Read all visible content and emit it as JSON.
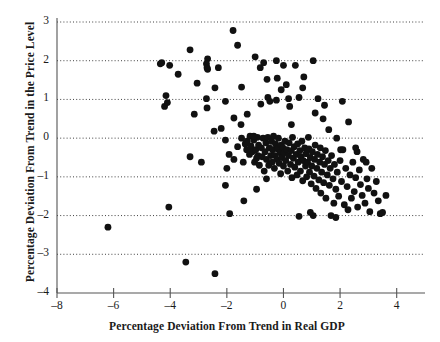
{
  "chart_data": {
    "type": "scatter",
    "title": "",
    "xlabel": "Percentage Deviation From Trend in Real GDP",
    "ylabel": "Percentage Deviation From Trend in the Price Level",
    "xlim": [
      -8,
      5
    ],
    "ylim": [
      -4,
      3
    ],
    "xticks": [
      -8,
      -6,
      -4,
      -2,
      0,
      2,
      4
    ],
    "yticks": [
      -4,
      -3,
      -2,
      -1,
      0,
      1,
      2,
      3
    ],
    "xtick_labels": [
      "-8",
      "-6",
      "-4",
      "-2",
      "0",
      "2",
      "4"
    ],
    "ytick_labels": [
      "-4",
      "-3",
      "-2",
      "-1",
      "0",
      "1",
      "2",
      "3"
    ],
    "grid": true,
    "grid_axis": "y",
    "grid_style": "dotted",
    "legend": null,
    "marker": "filled-circle",
    "marker_color": "#111111",
    "marker_size": 4.6,
    "n_points": 213,
    "series": [
      {
        "name": "Price level vs Real GDP deviation",
        "points": [
          [
            -6.2,
            -2.3
          ],
          [
            -4.05,
            -1.78
          ],
          [
            -3.45,
            -3.2
          ],
          [
            -2.42,
            -3.5
          ],
          [
            -4.35,
            1.92
          ],
          [
            -4.3,
            1.95
          ],
          [
            -4.15,
            1.1
          ],
          [
            -4.2,
            0.82
          ],
          [
            -4.1,
            0.92
          ],
          [
            -4.02,
            1.88
          ],
          [
            -3.72,
            1.65
          ],
          [
            -3.3,
            2.28
          ],
          [
            -3.3,
            -0.48
          ],
          [
            -3.15,
            0.62
          ],
          [
            -2.68,
            2.05
          ],
          [
            -2.72,
            1.92
          ],
          [
            -2.7,
            1.82
          ],
          [
            -2.68,
            1.78
          ],
          [
            -2.7,
            0.78
          ],
          [
            -2.72,
            1.02
          ],
          [
            -2.42,
            1.3
          ],
          [
            -2.3,
            1.82
          ],
          [
            -2.45,
            0.18
          ],
          [
            -2.2,
            0.25
          ],
          [
            -2.05,
            -0.05
          ],
          [
            -2.0,
            -0.78
          ],
          [
            -1.92,
            -0.42
          ],
          [
            -1.78,
            2.78
          ],
          [
            -1.75,
            -0.55
          ],
          [
            -1.62,
            2.4
          ],
          [
            -1.5,
            0.35
          ],
          [
            -1.48,
            0.0
          ],
          [
            -1.42,
            -0.62
          ],
          [
            -1.4,
            -1.62
          ],
          [
            -1.35,
            -0.15
          ],
          [
            -1.3,
            -0.3
          ],
          [
            -1.28,
            -0.08
          ],
          [
            -1.2,
            -0.42
          ],
          [
            -1.18,
            0.05
          ],
          [
            -1.15,
            -0.2
          ],
          [
            -1.1,
            -0.35
          ],
          [
            -1.05,
            -0.05
          ],
          [
            -1.02,
            -0.62
          ],
          [
            -1.0,
            2.1
          ],
          [
            -0.98,
            -0.3
          ],
          [
            -0.95,
            -0.52
          ],
          [
            -0.92,
            0.02
          ],
          [
            -0.9,
            -0.45
          ],
          [
            -0.88,
            -0.18
          ],
          [
            -0.85,
            -0.7
          ],
          [
            -0.82,
            1.82
          ],
          [
            -0.8,
            0.88
          ],
          [
            -0.78,
            -0.25
          ],
          [
            -0.75,
            -0.48
          ],
          [
            -0.72,
            0.0
          ],
          [
            -0.7,
            1.95
          ],
          [
            -0.68,
            -0.85
          ],
          [
            -0.65,
            -0.35
          ],
          [
            -0.62,
            -0.12
          ],
          [
            -0.6,
            -0.55
          ],
          [
            -0.58,
            1.52
          ],
          [
            -0.55,
            0.02
          ],
          [
            -0.52,
            -0.7
          ],
          [
            -0.5,
            -0.25
          ],
          [
            -0.48,
            0.95
          ],
          [
            -0.45,
            -0.45
          ],
          [
            -0.42,
            -0.08
          ],
          [
            -0.4,
            -0.62
          ],
          [
            -0.38,
            -0.3
          ],
          [
            -0.35,
            0.05
          ],
          [
            -0.32,
            -0.78
          ],
          [
            -0.3,
            -0.45
          ],
          [
            -0.28,
            -0.15
          ],
          [
            -0.25,
            2.0
          ],
          [
            -0.22,
            -0.55
          ],
          [
            -0.2,
            -0.28
          ],
          [
            -0.18,
            0.0
          ],
          [
            -0.15,
            -0.65
          ],
          [
            -0.12,
            -0.38
          ],
          [
            -0.1,
            -0.92
          ],
          [
            -0.08,
            -0.18
          ],
          [
            -0.05,
            -0.5
          ],
          [
            -0.02,
            -0.25
          ],
          [
            0.0,
            1.88
          ],
          [
            0.0,
            -0.72
          ],
          [
            0.02,
            -0.38
          ],
          [
            0.05,
            -0.08
          ],
          [
            0.08,
            -0.58
          ],
          [
            0.1,
            1.38
          ],
          [
            0.12,
            -0.3
          ],
          [
            0.15,
            -0.85
          ],
          [
            0.18,
            -0.45
          ],
          [
            0.2,
            -0.12
          ],
          [
            0.22,
            0.82
          ],
          [
            0.25,
            -0.68
          ],
          [
            0.28,
            -0.32
          ],
          [
            0.3,
            -1.02
          ],
          [
            0.32,
            0.02
          ],
          [
            0.35,
            -0.52
          ],
          [
            0.38,
            -0.22
          ],
          [
            0.4,
            -0.75
          ],
          [
            0.42,
            1.88
          ],
          [
            0.45,
            -0.42
          ],
          [
            0.48,
            -0.95
          ],
          [
            0.5,
            -0.15
          ],
          [
            0.52,
            -0.62
          ],
          [
            0.55,
            1.05
          ],
          [
            0.58,
            -0.32
          ],
          [
            0.6,
            -0.85
          ],
          [
            0.62,
            -0.48
          ],
          [
            0.65,
            -0.08
          ],
          [
            0.68,
            -1.1
          ],
          [
            0.7,
            -0.58
          ],
          [
            0.72,
            1.58
          ],
          [
            0.75,
            -0.25
          ],
          [
            0.78,
            -0.72
          ],
          [
            0.8,
            -0.4
          ],
          [
            0.82,
            -1.0
          ],
          [
            0.85,
            -0.62
          ],
          [
            0.88,
            0.02
          ],
          [
            0.9,
            -0.28
          ],
          [
            0.92,
            -0.88
          ],
          [
            0.95,
            -0.5
          ],
          [
            0.98,
            -1.18
          ],
          [
            1.0,
            -0.72
          ],
          [
            1.02,
            -0.35
          ],
          [
            1.05,
            2.0
          ],
          [
            1.08,
            -0.98
          ],
          [
            1.1,
            -0.55
          ],
          [
            1.12,
            -0.18
          ],
          [
            1.15,
            -1.3
          ],
          [
            1.18,
            -0.78
          ],
          [
            1.2,
            -0.42
          ],
          [
            1.22,
            1.02
          ],
          [
            1.25,
            -1.08
          ],
          [
            1.28,
            -0.62
          ],
          [
            1.3,
            -0.25
          ],
          [
            1.32,
            -1.42
          ],
          [
            1.35,
            -0.88
          ],
          [
            1.38,
            -0.48
          ],
          [
            1.4,
            0.5
          ],
          [
            1.42,
            -1.15
          ],
          [
            1.45,
            -0.68
          ],
          [
            1.48,
            -0.32
          ],
          [
            1.5,
            -1.55
          ],
          [
            1.55,
            -0.95
          ],
          [
            1.58,
            -0.58
          ],
          [
            1.6,
            0.22
          ],
          [
            1.62,
            -1.22
          ],
          [
            1.65,
            -0.78
          ],
          [
            1.68,
            -2.0
          ],
          [
            1.7,
            -0.45
          ],
          [
            1.75,
            -1.05
          ],
          [
            1.78,
            -1.68
          ],
          [
            1.8,
            -0.68
          ],
          [
            1.85,
            -1.32
          ],
          [
            1.88,
            0.0
          ],
          [
            1.9,
            -0.88
          ],
          [
            1.95,
            -1.5
          ],
          [
            2.0,
            -0.58
          ],
          [
            2.05,
            -1.12
          ],
          [
            2.1,
            -0.3
          ],
          [
            2.15,
            -1.72
          ],
          [
            2.2,
            -0.78
          ],
          [
            2.25,
            -1.25
          ],
          [
            2.3,
            0.42
          ],
          [
            2.35,
            -0.95
          ],
          [
            2.4,
            -1.55
          ],
          [
            2.45,
            -0.62
          ],
          [
            2.5,
            -1.38
          ],
          [
            2.55,
            -1.02
          ],
          [
            2.6,
            -0.35
          ],
          [
            2.62,
            -1.78
          ],
          [
            2.68,
            -0.82
          ],
          [
            2.72,
            -1.2
          ],
          [
            2.78,
            -1.48
          ],
          [
            2.82,
            -0.55
          ],
          [
            2.88,
            -1.68
          ],
          [
            2.95,
            -1.05
          ],
          [
            3.0,
            -1.3
          ],
          [
            3.05,
            -1.9
          ],
          [
            3.12,
            -0.78
          ],
          [
            3.2,
            -1.42
          ],
          [
            3.28,
            -1.12
          ],
          [
            3.35,
            -1.62
          ],
          [
            3.42,
            -1.95
          ],
          [
            3.5,
            -1.92
          ],
          [
            3.62,
            -1.48
          ],
          [
            0.55,
            -2.02
          ],
          [
            1.05,
            -2.0
          ],
          [
            2.02,
            -0.3
          ],
          [
            2.55,
            -0.25
          ],
          [
            2.92,
            -0.62
          ],
          [
            -0.55,
            1.05
          ],
          [
            -0.25,
            0.98
          ],
          [
            0.18,
            1.02
          ],
          [
            -1.05,
            0.05
          ],
          [
            -1.62,
            -0.22
          ],
          [
            -2.05,
            -1.22
          ],
          [
            -1.9,
            -1.95
          ],
          [
            -0.95,
            -1.32
          ],
          [
            -0.6,
            -1.05
          ],
          [
            0.95,
            -1.92
          ],
          [
            -1.48,
            1.32
          ],
          [
            -0.22,
            1.55
          ],
          [
            0.68,
            1.3
          ],
          [
            1.45,
            0.85
          ],
          [
            2.08,
            0.95
          ],
          [
            -3.05,
            1.42
          ],
          [
            -2.05,
            0.95
          ],
          [
            -1.28,
            0.62
          ],
          [
            0.28,
            0.35
          ],
          [
            1.12,
            0.65
          ],
          [
            -0.08,
            1.25
          ],
          [
            -1.75,
            0.52
          ],
          [
            1.85,
            -2.05
          ],
          [
            2.28,
            -1.85
          ],
          [
            -2.9,
            -0.62
          ]
        ]
      }
    ]
  }
}
